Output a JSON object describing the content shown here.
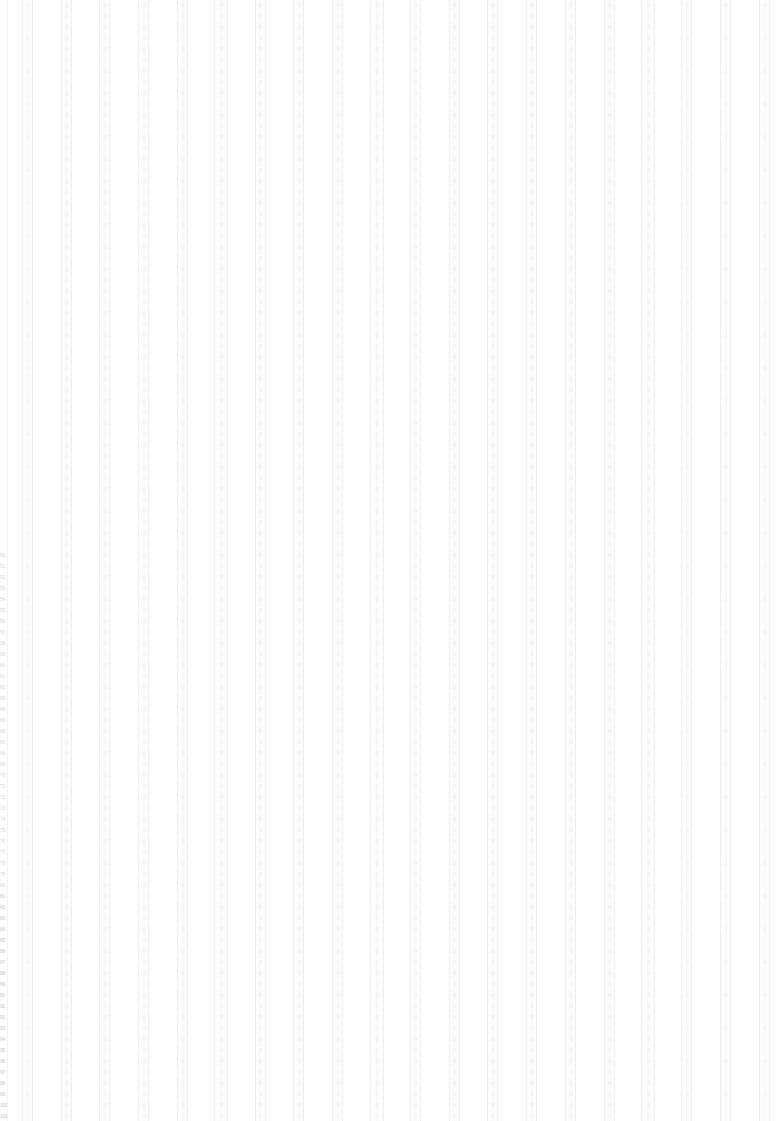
{
  "document": {
    "type": "wide-data-table",
    "background_color": "#ffffff",
    "rule_color": "#ededf0",
    "text_color": "#dadade",
    "index_text_color": "#d4d4d8",
    "column_count": 20,
    "row_count": 102,
    "row_height_px": 11,
    "column_pitch_px": 39
  },
  "index_column": {
    "name": "row-index",
    "visible_from_row": 50,
    "labels": [
      "",
      "",
      "",
      "",
      "",
      "",
      "",
      "",
      "",
      "",
      "",
      "",
      "",
      "",
      "",
      "",
      "",
      "",
      "",
      "",
      "",
      "",
      "",
      "",
      "",
      "",
      "",
      "",
      "",
      "",
      "",
      "",
      "",
      "",
      "",
      "",
      "",
      "",
      "",
      "",
      "",
      "",
      "",
      "",
      "",
      "",
      "",
      "",
      "",
      "",
      "50",
      "51",
      "52",
      "53",
      "54",
      "55",
      "56",
      "57",
      "58",
      "59",
      "60",
      "61",
      "62",
      "63",
      "64",
      "65",
      "66",
      "67",
      "68",
      "69",
      "70",
      "71",
      "72",
      "73",
      "74",
      "75",
      "76",
      "77",
      "78",
      "79",
      "80",
      "81",
      "82",
      "83",
      "84",
      "85",
      "86",
      "87",
      "88",
      "89",
      "90",
      "91",
      "92",
      "93",
      "94",
      "95",
      "96",
      "97",
      "98",
      "99",
      "100",
      "101"
    ]
  },
  "columns": [
    {
      "id": "c01",
      "header": "",
      "width": "narrow",
      "marks": "sparse"
    },
    {
      "id": "c02",
      "header": "",
      "width": "narrow",
      "marks": "dense"
    },
    {
      "id": "c03",
      "header": "",
      "width": "narrow",
      "marks": "dense"
    },
    {
      "id": "c04",
      "header": "",
      "width": "narrow",
      "marks": "dense"
    },
    {
      "id": "c05",
      "header": "",
      "width": "narrow",
      "marks": "dense"
    },
    {
      "id": "c06",
      "header": "",
      "width": "wide",
      "marks": "dense"
    },
    {
      "id": "c07",
      "header": "",
      "width": "narrow",
      "marks": "dense"
    },
    {
      "id": "c08",
      "header": "",
      "width": "narrow",
      "marks": "dense"
    },
    {
      "id": "c09",
      "header": "",
      "width": "narrow",
      "marks": "dense"
    },
    {
      "id": "c10",
      "header": "",
      "width": "wide",
      "marks": "dense"
    },
    {
      "id": "c11",
      "header": "",
      "width": "narrow",
      "marks": "dense"
    },
    {
      "id": "c12",
      "header": "",
      "width": "narrow",
      "marks": "dense"
    },
    {
      "id": "c13",
      "header": "",
      "width": "narrow",
      "marks": "dense"
    },
    {
      "id": "c14",
      "header": "",
      "width": "narrow",
      "marks": "dense"
    },
    {
      "id": "c15",
      "header": "",
      "width": "narrow",
      "marks": "dense"
    },
    {
      "id": "c16",
      "header": "",
      "width": "narrow",
      "marks": "dense"
    },
    {
      "id": "c17",
      "header": "",
      "width": "wide",
      "marks": "dense"
    },
    {
      "id": "c18",
      "header": "",
      "width": "narrow",
      "marks": "sparse"
    },
    {
      "id": "c19",
      "header": "",
      "width": "narrow",
      "marks": "sparse"
    },
    {
      "id": "c20",
      "header": "",
      "width": "narrow",
      "marks": "sparse"
    }
  ],
  "cell_glyph": "0"
}
